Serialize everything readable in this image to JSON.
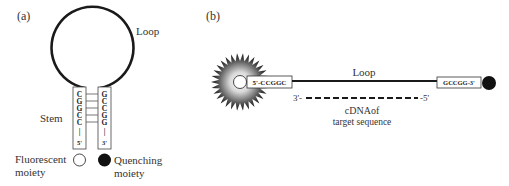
{
  "panel_a": {
    "label": "(a)",
    "loop_label": "Loop",
    "stem_label": "Stem",
    "left_strand": [
      "C",
      "G",
      "G",
      "C",
      "C",
      "|",
      "5'"
    ],
    "right_strand": [
      "G",
      "C",
      "C",
      "G",
      "G",
      "|",
      "3'"
    ],
    "fluorescent_line1": "Fluorescent",
    "fluorescent_line2": "moiety",
    "quenching_line1": "Quenching",
    "quenching_line2": "moiety"
  },
  "panel_b": {
    "label": "(b)",
    "loop_label": "Loop",
    "left_arm": "5'-CCGGC",
    "right_arm": "GCCGG-3'",
    "target_3prime": "3'-",
    "target_5prime": "-5'",
    "target_line1": "cDNAof",
    "target_line2": "target sequence"
  },
  "colors": {
    "line": "#1a1a1a",
    "text": "#333333",
    "quencher": "#111111"
  }
}
